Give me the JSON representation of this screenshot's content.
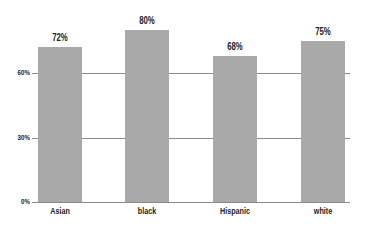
{
  "chart_data": {
    "type": "bar",
    "title": "",
    "xlabel": "",
    "ylabel": "",
    "categories": [
      "Asian",
      "black",
      "Hispanic",
      "white"
    ],
    "values": [
      72,
      80,
      68,
      75
    ],
    "value_labels": [
      "72%",
      "80%",
      "68%",
      "75%"
    ],
    "ylim": [
      0,
      80
    ],
    "yticks": [
      0,
      30,
      60
    ],
    "ytick_labels": [
      "0%",
      "30%",
      "60%"
    ],
    "grid": true,
    "legend": null,
    "bar_color": "#a9a9a9",
    "grid_color": "#8a8a8a"
  }
}
